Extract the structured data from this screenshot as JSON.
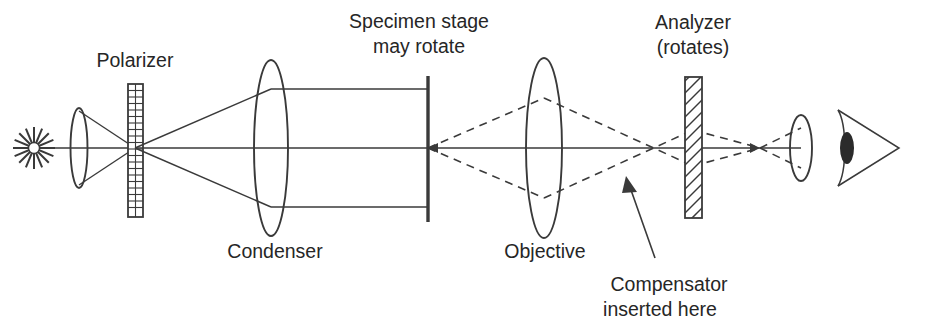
{
  "diagram": {
    "labels": {
      "polarizer": "Polarizer",
      "condenser": "Condenser",
      "specimen_stage_line1": "Specimen stage",
      "specimen_stage_line2": "may rotate",
      "objective": "Objective",
      "analyzer_line1": "Analyzer",
      "analyzer_line2": "(rotates)",
      "compensator_line1": "Compensator",
      "compensator_line2": "inserted here"
    },
    "components": [
      {
        "name": "light-source",
        "kind": "starburst",
        "x": 34,
        "y": 148
      },
      {
        "name": "collector-lens",
        "kind": "lens",
        "x": 79,
        "y": 148
      },
      {
        "name": "polarizer",
        "kind": "grid-plate",
        "x": 135,
        "y": 148
      },
      {
        "name": "condenser-lens",
        "kind": "lens",
        "x": 271,
        "y": 148
      },
      {
        "name": "specimen-stage",
        "kind": "bar",
        "x": 428,
        "y": 148
      },
      {
        "name": "objective-lens",
        "kind": "lens",
        "x": 544,
        "y": 148
      },
      {
        "name": "analyzer",
        "kind": "hatched-plate",
        "x": 693,
        "y": 148
      },
      {
        "name": "eyepiece-lens",
        "kind": "lens",
        "x": 801,
        "y": 148
      },
      {
        "name": "eye",
        "kind": "eye",
        "x": 872,
        "y": 148
      }
    ],
    "colors": {
      "ink": "#3a3a3a",
      "text": "#262626",
      "background": "#ffffff"
    },
    "ray_paths": {
      "solid_segment": "source through condenser to specimen stage",
      "dashed_segment": "specimen stage through objective and analyzer to eye"
    }
  }
}
